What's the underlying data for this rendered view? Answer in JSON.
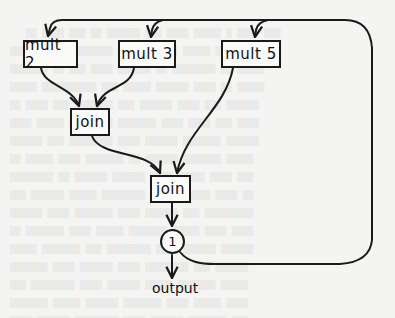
{
  "diagram": {
    "type": "dataflow",
    "nodes": {
      "mult2": {
        "label": "mult 2"
      },
      "mult3": {
        "label": "mult 3"
      },
      "mult5": {
        "label": "mult 5"
      },
      "join_top": {
        "label": "join"
      },
      "join_bottom": {
        "label": "join"
      },
      "merge_circle": {
        "label": "1"
      },
      "output": {
        "label": "output"
      }
    },
    "edges": [
      {
        "from": "mult2",
        "to": "join_top"
      },
      {
        "from": "mult3",
        "to": "join_top"
      },
      {
        "from": "join_top",
        "to": "join_bottom"
      },
      {
        "from": "mult5",
        "to": "join_bottom"
      },
      {
        "from": "join_bottom",
        "to": "merge_circle"
      },
      {
        "from": "merge_circle",
        "to": "output"
      },
      {
        "from": "merge_circle",
        "to": "mult2",
        "note": "feedback loop"
      },
      {
        "from": "merge_circle",
        "to": "mult3",
        "note": "feedback loop"
      },
      {
        "from": "merge_circle",
        "to": "mult5",
        "note": "feedback loop"
      }
    ],
    "colors": {
      "stroke": "#1a1a1a",
      "background": "#f4f4f2"
    }
  }
}
